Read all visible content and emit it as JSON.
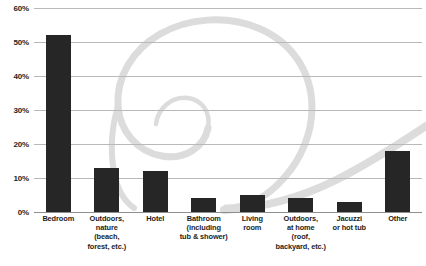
{
  "chart_data": {
    "type": "bar",
    "title": "",
    "xlabel": "",
    "ylabel": "",
    "ylim": [
      0,
      60
    ],
    "grid": true,
    "legend": false,
    "y_ticks": [
      "0%",
      "10%",
      "20%",
      "30%",
      "40%",
      "50%",
      "60%"
    ],
    "y_tick_values": [
      0,
      10,
      20,
      30,
      40,
      50,
      60
    ],
    "bar_color": "#262626",
    "gridline_color": "#b9b9b9",
    "categories": [
      "Bedroom",
      "Outdoors, nature (beach, forest, etc.)",
      "Hotel",
      "Bathroom (including tub & shower)",
      "Living room",
      "Outdoors, at home (roof, backyard, etc.)",
      "Jacuzzi or hot tub",
      "Other"
    ],
    "category_lines": [
      [
        "Bedroom"
      ],
      [
        "Outdoors,",
        "nature",
        "(beach,",
        "forest, etc.)"
      ],
      [
        "Hotel"
      ],
      [
        "Bathroom",
        "(including",
        "tub & shower)"
      ],
      [
        "Living",
        "room"
      ],
      [
        "Outdoors,",
        "at home",
        "(roof,",
        "backyard, etc.)"
      ],
      [
        "Jacuzzi",
        "or hot tub"
      ],
      [
        "Other"
      ]
    ],
    "values": [
      52,
      13,
      12,
      4,
      5,
      4,
      3,
      18
    ],
    "annotations": [
      {
        "name": "background-swirl-watermark",
        "description": "light gray decorative spiral / swirl graphic behind plot area",
        "color": "#dcdcdc"
      }
    ]
  }
}
